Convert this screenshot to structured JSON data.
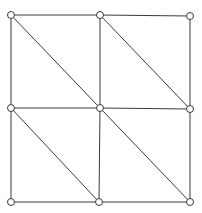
{
  "diagram": {
    "type": "triangulated-grid-mesh",
    "background": "#ffffff",
    "stroke_color": "#3a3a3a",
    "node_fill": "#ffffff",
    "node_radius": 3.5,
    "nodes": [
      {
        "id": "n00",
        "x": 11,
        "y": 15
      },
      {
        "id": "n01",
        "x": 100,
        "y": 15
      },
      {
        "id": "n02",
        "x": 190,
        "y": 16
      },
      {
        "id": "n10",
        "x": 11,
        "y": 108
      },
      {
        "id": "n11",
        "x": 100,
        "y": 108
      },
      {
        "id": "n12",
        "x": 190,
        "y": 109
      },
      {
        "id": "n20",
        "x": 11,
        "y": 202
      },
      {
        "id": "n21",
        "x": 99,
        "y": 202
      },
      {
        "id": "n22",
        "x": 190,
        "y": 202
      }
    ],
    "edges": [
      {
        "from": "n00",
        "to": "n01"
      },
      {
        "from": "n01",
        "to": "n02"
      },
      {
        "from": "n10",
        "to": "n11"
      },
      {
        "from": "n11",
        "to": "n12"
      },
      {
        "from": "n20",
        "to": "n21"
      },
      {
        "from": "n21",
        "to": "n22"
      },
      {
        "from": "n00",
        "to": "n10"
      },
      {
        "from": "n10",
        "to": "n20"
      },
      {
        "from": "n01",
        "to": "n11"
      },
      {
        "from": "n11",
        "to": "n21"
      },
      {
        "from": "n02",
        "to": "n12"
      },
      {
        "from": "n12",
        "to": "n22"
      },
      {
        "from": "n00",
        "to": "n11"
      },
      {
        "from": "n01",
        "to": "n12"
      },
      {
        "from": "n10",
        "to": "n21"
      },
      {
        "from": "n11",
        "to": "n22"
      }
    ]
  }
}
